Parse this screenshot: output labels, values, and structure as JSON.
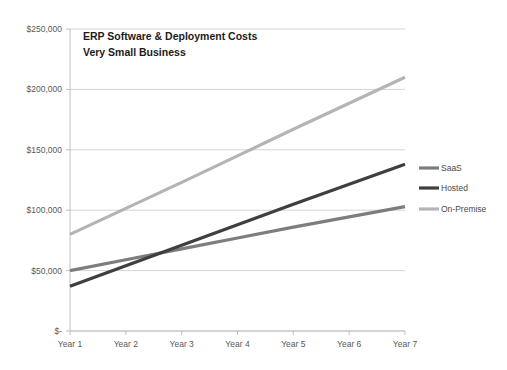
{
  "chart_data": {
    "type": "line",
    "title": "ERP Software & Deployment Costs",
    "subtitle": "Very Small Business",
    "xlabel": "",
    "ylabel": "",
    "categories": [
      "Year 1",
      "Year 2",
      "Year 3",
      "Year 4",
      "Year 5",
      "Year 6",
      "Year 7"
    ],
    "ylim": [
      0,
      250000
    ],
    "ytick_values": [
      0,
      50000,
      100000,
      150000,
      200000,
      250000
    ],
    "ytick_labels": [
      "$-",
      "$50,000",
      "$100,000",
      "$150,000",
      "$200,000",
      "$250,000"
    ],
    "grid": true,
    "legend_position": "right",
    "series": [
      {
        "name": "SaaS",
        "color": "#7d7d7d",
        "values": [
          50000,
          59000,
          68000,
          77000,
          86000,
          94500,
          103000
        ]
      },
      {
        "name": "Hosted",
        "color": "#3f3f3f",
        "values": [
          37000,
          54000,
          71000,
          88000,
          105000,
          121500,
          138000
        ]
      },
      {
        "name": "On-Premise",
        "color": "#b4b4b4",
        "values": [
          80000,
          101500,
          123000,
          145000,
          167000,
          188500,
          210000
        ]
      }
    ]
  },
  "legend": {
    "items": [
      {
        "label": "SaaS",
        "color": "#7d7d7d"
      },
      {
        "label": "Hosted",
        "color": "#3f3f3f"
      },
      {
        "label": "On-Premise",
        "color": "#b4b4b4"
      }
    ]
  },
  "plot_geometry": {
    "left": 70,
    "right": 405,
    "top": 29,
    "bottom": 331
  }
}
